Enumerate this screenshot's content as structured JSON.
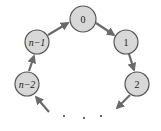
{
  "diagram": {
    "type": "circular-linked-list",
    "colors": {
      "node_fill": "#d8d8d8",
      "node_stroke": "#555555",
      "edge": "#6a6a6a",
      "text": "#222222",
      "background": "#ffffff"
    },
    "nodes": [
      {
        "id": "n-2",
        "label": "n−2",
        "cx": 27,
        "cy": 84,
        "r": 12
      },
      {
        "id": "n-1",
        "label": "n−1",
        "cx": 37,
        "cy": 42,
        "r": 12
      },
      {
        "id": "0",
        "label": "0",
        "cx": 83,
        "cy": 19,
        "r": 13
      },
      {
        "id": "1",
        "label": "1",
        "cx": 126,
        "cy": 42,
        "r": 12
      },
      {
        "id": "2",
        "label": "2",
        "cx": 137,
        "cy": 84,
        "r": 12
      }
    ],
    "edges": [
      {
        "from": "n-2",
        "to": "n-1"
      },
      {
        "from": "n-1",
        "to": "0"
      },
      {
        "from": "0",
        "to": "1"
      },
      {
        "from": "1",
        "to": "2"
      },
      {
        "from": "2",
        "to": "ellipsis"
      },
      {
        "from": "ellipsis",
        "to": "n-2"
      }
    ],
    "ellipsis": "· · ·"
  }
}
